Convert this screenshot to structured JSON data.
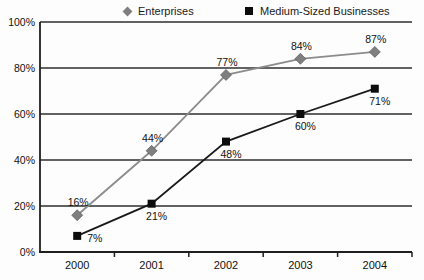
{
  "chart_data": {
    "type": "line",
    "categories": [
      "2000",
      "2001",
      "2002",
      "2003",
      "2004"
    ],
    "series": [
      {
        "name": "Enterprises",
        "marker": "diamond",
        "color": "#7f7f7f",
        "line_color": "#8c8c8c",
        "values": [
          16,
          44,
          77,
          84,
          87
        ],
        "point_labels": [
          "16%",
          "44%",
          "77%",
          "84%",
          "87%"
        ],
        "label_positions": [
          "above",
          "above",
          "above",
          "above",
          "above"
        ]
      },
      {
        "name": "Medium-Sized Businesses",
        "marker": "square",
        "color": "#0d0d0d",
        "line_color": "#1a1a1a",
        "values": [
          7,
          21,
          48,
          60,
          71
        ],
        "point_labels": [
          "7%",
          "21%",
          "48%",
          "60%",
          "71%"
        ],
        "label_positions": [
          "right",
          "below",
          "below",
          "below",
          "below"
        ]
      }
    ],
    "title": "",
    "xlabel": "",
    "ylabel": "",
    "ylim": [
      0,
      100
    ],
    "ytick_step": 20,
    "ytick_labels": [
      "0%",
      "20%",
      "40%",
      "60%",
      "80%",
      "100%"
    ],
    "grid": true,
    "legend_position": "top",
    "axis_color": "#1f1f1f",
    "grid_color": "#2e2e2e",
    "text_color": "#111111"
  }
}
